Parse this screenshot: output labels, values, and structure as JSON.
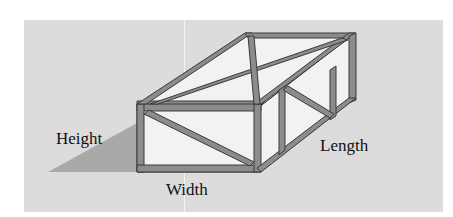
{
  "diagram": {
    "type": "isometric frame box",
    "labels": {
      "height": "Height",
      "width": "Width",
      "length": "Length"
    },
    "colors": {
      "background_panel": "#dcdcdc",
      "frame_fill": "#8c8c8c",
      "frame_outline": "#3a3a3a",
      "face_fill": "#f2f2f2",
      "shadow": "#a9a9a9"
    }
  }
}
